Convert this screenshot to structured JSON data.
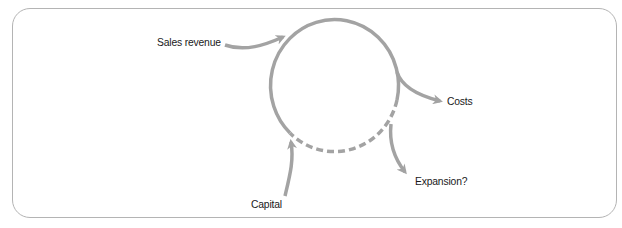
{
  "diagram": {
    "type": "cash-flow cycle",
    "stroke_color": "#a3a3a3",
    "border_color": "#b4b4b4",
    "cycle": {
      "solid_segment": "upper and left arc of circle",
      "dashed_segment": "lower arc of circle"
    },
    "labels": {
      "sales_revenue": "Sales revenue",
      "costs": "Costs",
      "capital": "Capital",
      "expansion": "Expansion?"
    },
    "flows": [
      {
        "name": "Sales revenue",
        "direction": "in"
      },
      {
        "name": "Costs",
        "direction": "out"
      },
      {
        "name": "Capital",
        "direction": "in"
      },
      {
        "name": "Expansion?",
        "direction": "out"
      }
    ]
  }
}
